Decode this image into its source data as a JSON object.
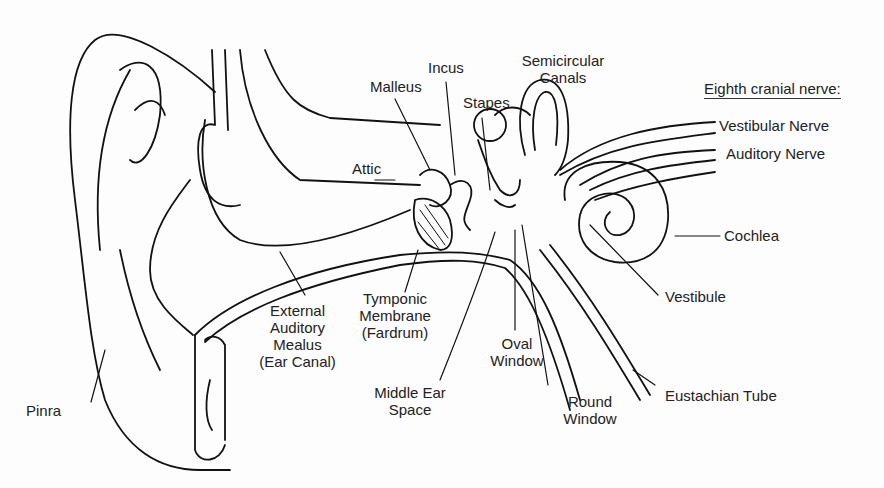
{
  "diagram": {
    "nerve_header": "Eighth cranial nerve:",
    "labels": {
      "pinna": "Pinra",
      "attic": "Attic",
      "malleus": "Malleus",
      "incus": "Incus",
      "stapes": "Stapes",
      "semicircular_1": "Semicircular",
      "semicircular_2": "Canals",
      "vestibular_nerve": "Vestibular Nerve",
      "auditory_nerve": "Auditory Nerve",
      "cochlea": "Cochlea",
      "vestibule": "Vestibule",
      "eustachian_tube": "Eustachian Tube",
      "round_window_1": "Round",
      "round_window_2": "Window",
      "oval_window_1": "Oval",
      "oval_window_2": "Window",
      "middle_ear_1": "Middle Ear",
      "middle_ear_2": "Space",
      "tympanic_1": "Tymponic",
      "tympanic_2": "Membrane",
      "tympanic_3": "(Fardrum)",
      "canal_1": "External",
      "canal_2": "Auditory",
      "canal_3": "Mealus",
      "canal_4": "(Ear Canal)"
    }
  }
}
